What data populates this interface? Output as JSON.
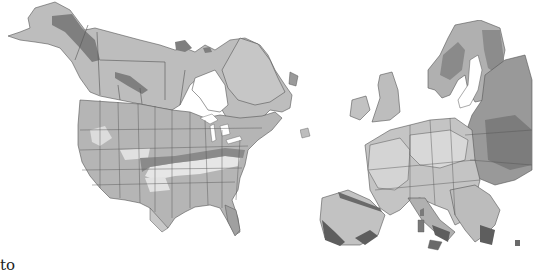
{
  "figure": {
    "caption_fragment": "to",
    "colors": {
      "background": "#ffffff",
      "land_base": "#bdbdbd",
      "zone_light": "#d9d9d9",
      "zone_mid": "#a8a8a8",
      "zone_dark": "#7f7f7f",
      "zone_darkest": "#5e5e5e",
      "border": "#444444",
      "water": "#ffffff"
    },
    "maps": [
      {
        "id": "north-america",
        "label": "North America zone map"
      },
      {
        "id": "europe",
        "label": "Europe zone map"
      }
    ]
  }
}
